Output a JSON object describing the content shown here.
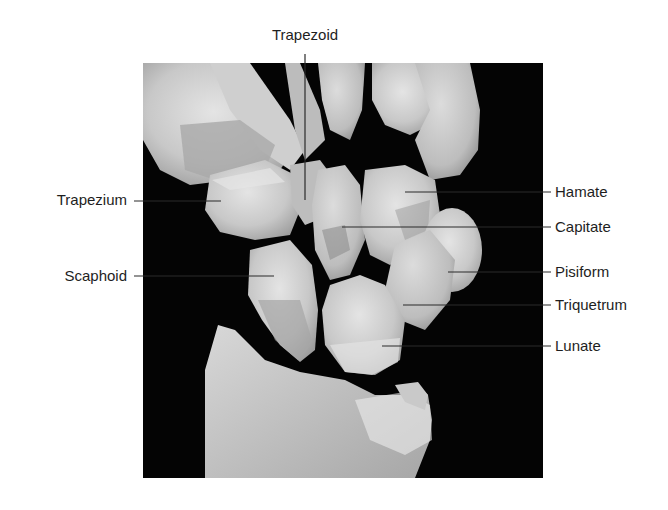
{
  "figure": {
    "background_color": "#ffffff",
    "panel_color": "#040404",
    "leader_line_color": "#2a2a2a",
    "label_color": "#1e1e1e"
  },
  "labels": {
    "top": [
      {
        "id": "trapezoid",
        "text": "Trapezoid",
        "x": 305,
        "y": 35,
        "line": {
          "x1": 305,
          "y1": 54,
          "x2": 305,
          "y2": 200
        }
      }
    ],
    "left": [
      {
        "id": "trapezium",
        "text": "Trapezium",
        "x": 125,
        "y": 200,
        "line": {
          "x1": 134,
          "y1": 201,
          "x2": 221,
          "y2": 201
        }
      },
      {
        "id": "scaphoid",
        "text": "Scaphoid",
        "x": 125,
        "y": 276,
        "line": {
          "x1": 134,
          "y1": 276,
          "x2": 274,
          "y2": 276
        }
      }
    ],
    "right": [
      {
        "id": "hamate",
        "text": "Hamate",
        "x": 555,
        "y": 192,
        "line": {
          "x1": 405,
          "y1": 192,
          "x2": 551,
          "y2": 192
        }
      },
      {
        "id": "capitate",
        "text": "Capitate",
        "x": 555,
        "y": 227,
        "line": {
          "x1": 342,
          "y1": 227,
          "x2": 551,
          "y2": 227
        }
      },
      {
        "id": "pisiform",
        "text": "Pisiform",
        "x": 555,
        "y": 272,
        "line": {
          "x1": 448,
          "y1": 272,
          "x2": 551,
          "y2": 272
        }
      },
      {
        "id": "triquetrum",
        "text": "Triquetrum",
        "x": 555,
        "y": 305,
        "line": {
          "x1": 403,
          "y1": 305,
          "x2": 551,
          "y2": 305
        }
      },
      {
        "id": "lunate",
        "text": "Lunate",
        "x": 555,
        "y": 346,
        "line": {
          "x1": 382,
          "y1": 346,
          "x2": 551,
          "y2": 346
        }
      }
    ]
  }
}
